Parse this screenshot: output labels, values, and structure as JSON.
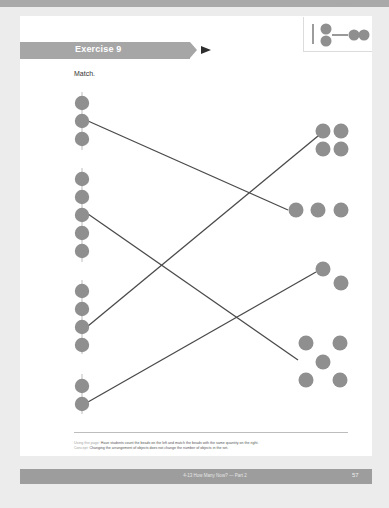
{
  "header": {
    "band_color": "#a9a9a9"
  },
  "exercise": {
    "title": "Exercise 9",
    "instruction": "Match.",
    "banner_color": "#a6a6a6",
    "arrow_color": "#2e2e2e"
  },
  "corner_icon": {
    "name": "bead-matching-icon"
  },
  "colors": {
    "bead": "#8f8f8f",
    "line": "#4a4a4a",
    "string": "#bdbdbd"
  },
  "left_groups": [
    {
      "count": 3
    },
    {
      "count": 5
    },
    {
      "count": 4
    },
    {
      "count": 2
    }
  ],
  "right_sets": [
    {
      "count": 4,
      "arrangement": "2x2 square"
    },
    {
      "count": 3,
      "arrangement": "row"
    },
    {
      "count": 2,
      "arrangement": "diagonal"
    },
    {
      "count": 5,
      "arrangement": "quincunx"
    }
  ],
  "matches": [
    {
      "left": 3,
      "right": 3
    },
    {
      "left": 5,
      "right": 5
    },
    {
      "left": 4,
      "right": 4
    },
    {
      "left": 2,
      "right": 2
    }
  ],
  "notes": {
    "using_label": "Using this page:",
    "using_text": "Have students count the beads on the left and match the beads with the same quantity on the right.",
    "concept_label": "Concept:",
    "concept_text": "Changing the arrangement of objects does not change the number of objects in the set."
  },
  "footer": {
    "lesson_title": "4-13 How Many Now? — Part 2",
    "page_number": "57"
  }
}
